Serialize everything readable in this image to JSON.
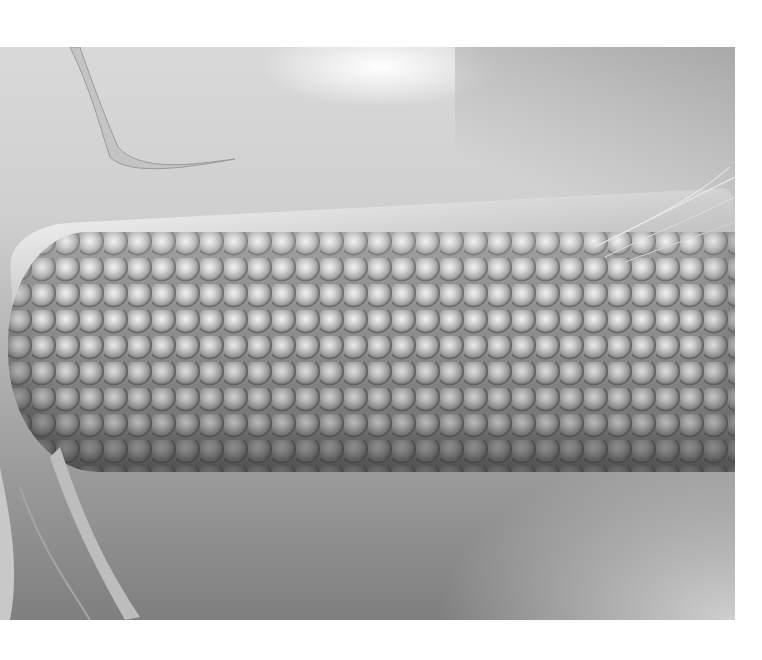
{
  "image": {
    "subject": "ear of corn on a plate",
    "style": "grayscale photograph",
    "background_color": "#ffffff",
    "photo_bounds": {
      "x": 0,
      "y": 47,
      "width": 735,
      "height": 573
    },
    "tones": {
      "highlight": "#ffffff",
      "plate_light": "#d9d9d9",
      "plate_shadow": "#7f7f7f",
      "kernel_highlight": "#f3f3f3",
      "kernel_mid": "#9b9b9b"
    }
  }
}
